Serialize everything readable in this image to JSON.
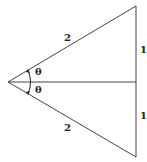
{
  "diagram": {
    "type": "geometry",
    "points": {
      "apex": [
        8,
        82
      ],
      "top": [
        136,
        6
      ],
      "bottom": [
        136,
        157
      ],
      "mid": [
        136,
        82
      ]
    },
    "labels": {
      "upper_hypotenuse": "2",
      "lower_hypotenuse": "2",
      "upper_leg": "1",
      "lower_leg": "1",
      "upper_angle": "θ",
      "lower_angle": "θ"
    },
    "colors": {
      "line": "#444444",
      "text": "#222222"
    }
  }
}
